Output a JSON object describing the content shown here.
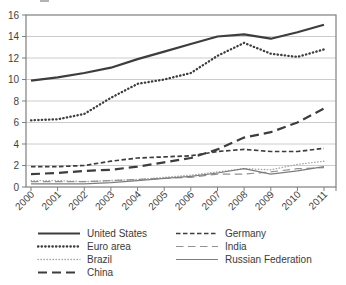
{
  "figure": {
    "cropped_title_fragment": ""
  },
  "colors": {
    "background": "#ffffff",
    "grid": "#cccccc",
    "border": "#7f7f7f",
    "tick_text": "#3f3f3f",
    "legend_text": "#3a3a3a",
    "line_dark": "#3d3d3d",
    "line_gray_light": "#a8a8a8",
    "line_gray_mid": "#919191",
    "line_gray": "#7d7d7d"
  },
  "chart_data": {
    "type": "line",
    "title": "",
    "xlabel": "",
    "ylabel": "",
    "x": [
      2000,
      2001,
      2002,
      2003,
      2004,
      2005,
      2006,
      2007,
      2008,
      2009,
      2010,
      2011
    ],
    "ylim": [
      0,
      16
    ],
    "yticks": [
      0,
      2,
      4,
      6,
      8,
      10,
      12,
      14,
      16
    ],
    "grid": "horizontal",
    "legend_position": "bottom",
    "legend_columns": [
      [
        "United States",
        "Euro area",
        "Brazil",
        "China"
      ],
      [
        "Germany",
        "India",
        "Russian Federation"
      ]
    ],
    "series": [
      {
        "name": "United States",
        "values": [
          9.9,
          10.2,
          10.6,
          11.1,
          11.9,
          12.6,
          13.3,
          14.0,
          14.2,
          13.8,
          14.4,
          15.1
        ],
        "style": {
          "color": "#3d3d3d",
          "width": 2.2,
          "dash": "",
          "linecap": "butt"
        }
      },
      {
        "name": "Euro area",
        "values": [
          6.2,
          6.3,
          6.8,
          8.3,
          9.6,
          10.0,
          10.6,
          12.2,
          13.4,
          12.4,
          12.1,
          12.8
        ],
        "style": {
          "color": "#3d3d3d",
          "width": 2.3,
          "dash": "0.4 3.2",
          "linecap": "round"
        }
      },
      {
        "name": "Brazil",
        "values": [
          0.6,
          0.6,
          0.5,
          0.6,
          0.7,
          0.9,
          1.1,
          1.4,
          1.7,
          1.6,
          2.1,
          2.4
        ],
        "style": {
          "color": "#a8a8a8",
          "width": 1.4,
          "dash": "0.4 2.6",
          "linecap": "round"
        }
      },
      {
        "name": "China",
        "values": [
          1.2,
          1.3,
          1.5,
          1.6,
          1.9,
          2.3,
          2.7,
          3.5,
          4.6,
          5.1,
          6.0,
          7.3
        ],
        "style": {
          "color": "#3d3d3d",
          "width": 2.2,
          "dash": "9 5",
          "linecap": "butt"
        }
      },
      {
        "name": "Germany",
        "values": [
          1.9,
          1.9,
          2.0,
          2.4,
          2.7,
          2.8,
          2.9,
          3.3,
          3.5,
          3.3,
          3.3,
          3.6
        ],
        "style": {
          "color": "#3d3d3d",
          "width": 1.7,
          "dash": "4.5 2.5",
          "linecap": "butt"
        }
      },
      {
        "name": "India",
        "values": [
          0.5,
          0.5,
          0.5,
          0.6,
          0.7,
          0.8,
          0.9,
          1.2,
          1.2,
          1.4,
          1.7,
          1.8
        ],
        "style": {
          "color": "#919191",
          "width": 1.2,
          "dash": "7.5 4.5",
          "linecap": "butt"
        }
      },
      {
        "name": "Russian Federation",
        "values": [
          0.3,
          0.3,
          0.3,
          0.4,
          0.6,
          0.8,
          1.0,
          1.3,
          1.7,
          1.2,
          1.5,
          1.9
        ],
        "style": {
          "color": "#7d7d7d",
          "width": 1.2,
          "dash": "",
          "linecap": "butt"
        }
      }
    ]
  }
}
